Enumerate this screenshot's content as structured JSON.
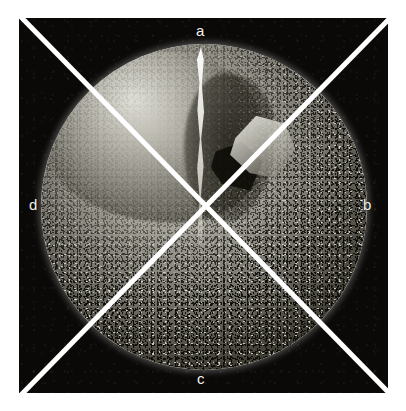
{
  "figure": {
    "background_color": "#ffffff",
    "panel_color": "#0a0908",
    "line_color": "#ffffff",
    "label_color": "#f3f2ec"
  },
  "labels": {
    "top": "a",
    "right": "b",
    "bottom": "c",
    "left": "d"
  },
  "quadrants": [
    {
      "id": "a",
      "position": "top",
      "label": "a",
      "description": "upper quadrant, smooth fracture face with vertical crack"
    },
    {
      "id": "b",
      "position": "right",
      "label": "b",
      "description": "right quadrant, coarse granular texture"
    },
    {
      "id": "c",
      "position": "bottom",
      "label": "c",
      "description": "lower quadrant, dense speckled texture"
    },
    {
      "id": "d",
      "position": "left",
      "label": "d",
      "description": "left quadrant, fine granular texture"
    }
  ],
  "specimen": {
    "shape": "sphere",
    "center_x": 205,
    "center_y": 206,
    "radius": 163,
    "features": [
      "bright specular rim",
      "vertical fracture crack",
      "chipped flake upper-right",
      "granular crystalline surface"
    ]
  },
  "divider_lines": [
    {
      "name": "diagonal-nw-se",
      "x1": 20,
      "y1": 16,
      "x2": 392,
      "y2": 396
    },
    {
      "name": "diagonal-ne-sw",
      "x1": 392,
      "y1": 16,
      "x2": 20,
      "y2": 396
    }
  ]
}
